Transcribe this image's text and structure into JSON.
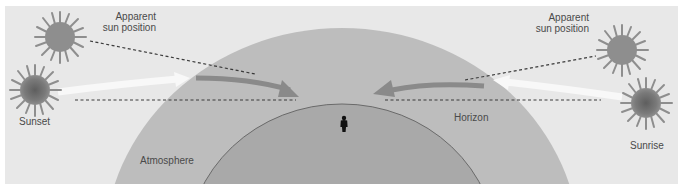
{
  "diagram": {
    "colors": {
      "background": "#e8e8e8",
      "frame": "#ffffff",
      "atmosphere": "#bdbdbd",
      "earth": "#a9a9a9",
      "earth_outline": "#6a6a6a",
      "refracted_arrow": "#8a8a8a",
      "true_light_arrow": "#f8f8f8",
      "dashed_line": "#3a3a3a",
      "sun_apparent": "#8e8e8e",
      "sun_true_core": "#6e6e6e",
      "observer": "#111111",
      "text": "#4a4a4a"
    },
    "labels": {
      "apparent_left_line1": "Apparent",
      "apparent_left_line2": "sun position",
      "apparent_right_line1": "Apparent",
      "apparent_right_line2": "sun position",
      "sunset": "Sunset",
      "sunrise": "Sunrise",
      "horizon": "Horizon",
      "atmosphere": "Atmosphere"
    },
    "icons": {
      "apparent_sun": "sun-icon",
      "true_sun": "sun-icon",
      "observer": "person-icon",
      "arrow": "arrow-icon"
    }
  }
}
